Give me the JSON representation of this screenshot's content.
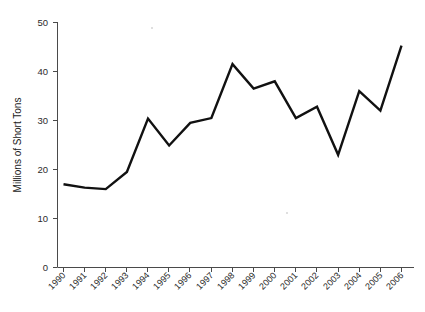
{
  "chart_data": {
    "type": "line",
    "title": "",
    "xlabel": "",
    "ylabel": "Millions of Short Tons",
    "categories": [
      "1990",
      "1991",
      "1992",
      "1993",
      "1994",
      "1995",
      "1996",
      "1997",
      "1998",
      "1999",
      "2000",
      "2001",
      "2002",
      "2003",
      "2004",
      "2005",
      "2006"
    ],
    "values": [
      17.0,
      16.3,
      16.0,
      19.5,
      30.4,
      24.9,
      29.5,
      30.5,
      41.5,
      36.5,
      38.0,
      30.5,
      32.8,
      23.0,
      36.0,
      32.0,
      45.3
    ],
    "ylim": [
      0,
      50
    ],
    "yticks": [
      0,
      10,
      20,
      30,
      40,
      50
    ],
    "ytick_labels": [
      "0",
      "10",
      "20",
      "30",
      "40",
      "50"
    ],
    "xtick_labels": [
      "1990",
      "1991",
      "1992",
      "1993",
      "1994",
      "1995",
      "1996",
      "1997",
      "1998",
      "1999",
      "2000",
      "2001",
      "2002",
      "2003",
      "2004",
      "2005",
      "2006"
    ],
    "grid": false,
    "legend": null,
    "legend_position": "none",
    "series_color": "#111111"
  },
  "axis": {
    "y_label": "Millions of Short Tons",
    "y_tick_0": "0",
    "y_tick_10": "10",
    "y_tick_20": "20",
    "y_tick_30": "30",
    "y_tick_40": "40",
    "y_tick_50": "50"
  },
  "title": {
    "text": ""
  }
}
